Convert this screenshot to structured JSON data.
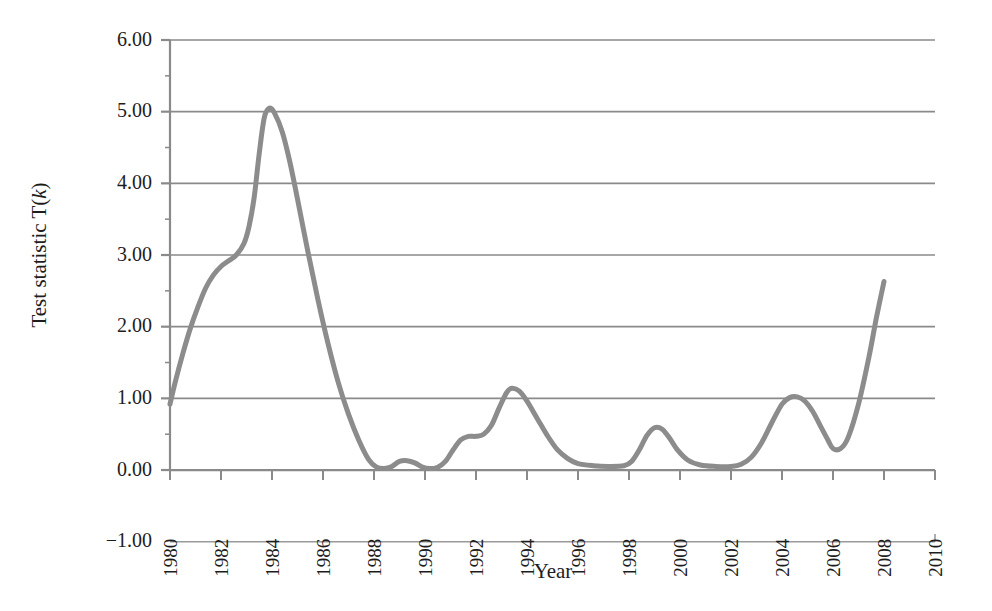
{
  "chart_data": {
    "type": "line",
    "title": "",
    "subtitle": "",
    "xlabel": "Year",
    "ylabel": "Test statistic T(k)",
    "ylabel_prefix": "Test statistic T(",
    "ylabel_italic": "k",
    "ylabel_suffix": ")",
    "xlim": [
      1980,
      2010
    ],
    "ylim": [
      -1.0,
      6.0
    ],
    "grid": "horizontal",
    "legend": "none",
    "line_color": "#8c8c8c",
    "axis_color": "#8a8a8a",
    "text_color": "#1d1d1d",
    "line_width": 5,
    "ytick_labels": [
      "6.00",
      "5.00",
      "4.00",
      "3.00",
      "2.00",
      "1.00",
      "0.00",
      "-1.00"
    ],
    "ytick_values": [
      6.0,
      5.0,
      4.0,
      3.0,
      2.0,
      1.0,
      0.0,
      -1.0
    ],
    "ytick_minor_values": [
      5.5,
      4.5,
      3.5,
      2.5,
      1.5,
      0.5
    ],
    "xtick_labels": [
      "1980",
      "1982",
      "1984",
      "1986",
      "1988",
      "1990",
      "1992",
      "1994",
      "1996",
      "1998",
      "2000",
      "2002",
      "2004",
      "2006",
      "2008",
      "2010"
    ],
    "xtick_values": [
      1980,
      1982,
      1984,
      1986,
      1988,
      1990,
      1992,
      1994,
      1996,
      1998,
      2000,
      2002,
      2004,
      2006,
      2008,
      2010
    ],
    "xtick_rotation": -90,
    "series": [
      {
        "name": "T(k)",
        "x": [
          1980.0,
          1980.2,
          1980.5,
          1980.8,
          1981.1,
          1981.4,
          1981.7,
          1982.0,
          1982.3,
          1982.6,
          1982.9,
          1983.1,
          1983.3,
          1983.5,
          1983.7,
          1983.9,
          1984.1,
          1984.4,
          1984.7,
          1985.0,
          1985.4,
          1985.8,
          1986.2,
          1986.6,
          1987.0,
          1987.4,
          1987.8,
          1988.1,
          1988.4,
          1988.7,
          1989.0,
          1989.3,
          1989.6,
          1989.9,
          1990.2,
          1990.5,
          1990.8,
          1991.1,
          1991.4,
          1991.7,
          1992.0,
          1992.3,
          1992.6,
          1992.9,
          1993.2,
          1993.4,
          1993.7,
          1994.0,
          1994.4,
          1994.8,
          1995.2,
          1995.6,
          1996.0,
          1996.6,
          1997.2,
          1997.8,
          1998.1,
          1998.4,
          1998.7,
          1999.0,
          1999.3,
          1999.6,
          1999.9,
          2000.3,
          2000.8,
          2001.4,
          2002.0,
          2002.4,
          2002.8,
          2003.2,
          2003.6,
          2004.0,
          2004.3,
          2004.6,
          2004.9,
          2005.2,
          2005.5,
          2005.8,
          2006.0,
          2006.3,
          2006.6,
          2007.0,
          2007.4,
          2007.7,
          2008.0
        ],
        "y": [
          0.92,
          1.22,
          1.62,
          1.98,
          2.28,
          2.54,
          2.72,
          2.84,
          2.92,
          3.0,
          3.16,
          3.4,
          3.8,
          4.42,
          4.92,
          5.05,
          4.98,
          4.72,
          4.3,
          3.78,
          3.06,
          2.38,
          1.76,
          1.22,
          0.78,
          0.42,
          0.14,
          0.04,
          0.02,
          0.05,
          0.12,
          0.13,
          0.1,
          0.04,
          0.02,
          0.04,
          0.12,
          0.28,
          0.42,
          0.47,
          0.47,
          0.5,
          0.62,
          0.86,
          1.08,
          1.14,
          1.1,
          0.96,
          0.72,
          0.48,
          0.28,
          0.16,
          0.09,
          0.06,
          0.05,
          0.06,
          0.12,
          0.28,
          0.48,
          0.59,
          0.57,
          0.44,
          0.28,
          0.14,
          0.07,
          0.05,
          0.05,
          0.08,
          0.18,
          0.38,
          0.66,
          0.92,
          1.01,
          1.02,
          0.96,
          0.82,
          0.62,
          0.42,
          0.3,
          0.3,
          0.46,
          0.92,
          1.56,
          2.12,
          2.63
        ]
      }
    ]
  },
  "axis_titles": {
    "x": "Year",
    "y_prefix": "Test statistic T(",
    "y_italic": "k",
    "y_suffix": ")"
  }
}
